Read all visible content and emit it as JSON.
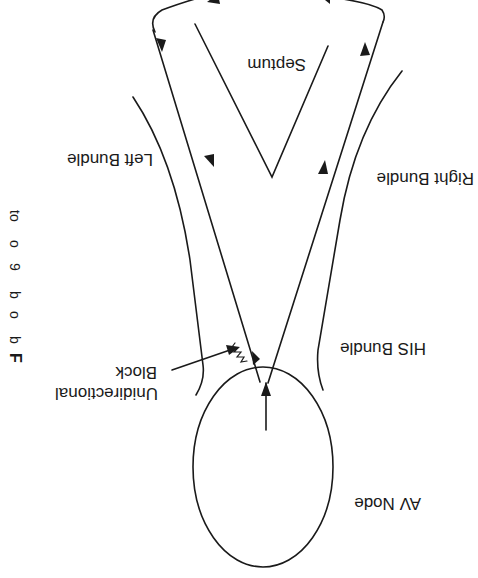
{
  "diagram": {
    "orientation": "rotated 180 degrees",
    "labels": {
      "septum": "Septum",
      "left_bundle": "Left Bundle",
      "right_bundle": "Right Bundle",
      "his_bundle": "HIS Bundle",
      "unidirectional_line1": "Unidirectional",
      "unidirectional_line2": "Block",
      "av_node": "AV Node"
    },
    "caption_fragment": {
      "bold_initial": "F",
      "chars": [
        "b",
        "o",
        "b",
        "9",
        "o",
        "to"
      ]
    },
    "colors": {
      "ink": "#1a1a1a",
      "background": "#ffffff"
    }
  }
}
